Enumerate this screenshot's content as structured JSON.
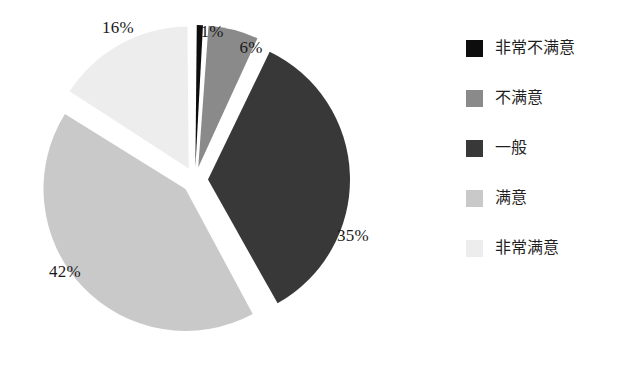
{
  "background_color": "#ffffff",
  "chart_data": {
    "type": "pie",
    "title": "",
    "exploded": true,
    "start_angle_deg": 0,
    "direction": "clockwise",
    "categories": [
      "非常不满意",
      "不满意",
      "一般",
      "满意",
      "非常满意"
    ],
    "values": [
      1,
      6,
      35,
      42,
      16
    ],
    "value_unit": "%",
    "colors": [
      "#0d0d0d",
      "#8a8a8a",
      "#383838",
      "#c9c9c9",
      "#ededed"
    ],
    "legend_position": "right",
    "grid": false,
    "slices": [
      {
        "label": "非常不满意",
        "value": 1,
        "display_value": "1%",
        "color": "#0d0d0d",
        "label_x": 212,
        "label_y": 32
      },
      {
        "label": "不满意",
        "value": 6,
        "display_value": "6%",
        "color": "#8a8a8a",
        "label_x": 251,
        "label_y": 48
      },
      {
        "label": "一般",
        "value": 35,
        "display_value": "35%",
        "color": "#383838",
        "label_x": 353,
        "label_y": 236
      },
      {
        "label": "满意",
        "value": 42,
        "display_value": "42%",
        "color": "#c9c9c9",
        "label_x": 65,
        "label_y": 272
      },
      {
        "label": "非常满意",
        "value": 16,
        "display_value": "16%",
        "color": "#ededed",
        "label_x": 118,
        "label_y": 28
      }
    ]
  },
  "labels": {
    "very_dissatisfied": "1%",
    "dissatisfied": "6%",
    "neutral": "35%",
    "satisfied": "42%",
    "very_satisfied": "16%"
  },
  "legend": {
    "items": [
      {
        "label": "非常不满意",
        "color": "#0d0d0d"
      },
      {
        "label": "不满意",
        "color": "#8a8a8a"
      },
      {
        "label": "一般",
        "color": "#383838"
      },
      {
        "label": "满意",
        "color": "#c9c9c9"
      },
      {
        "label": "非常满意",
        "color": "#ededed"
      }
    ]
  }
}
